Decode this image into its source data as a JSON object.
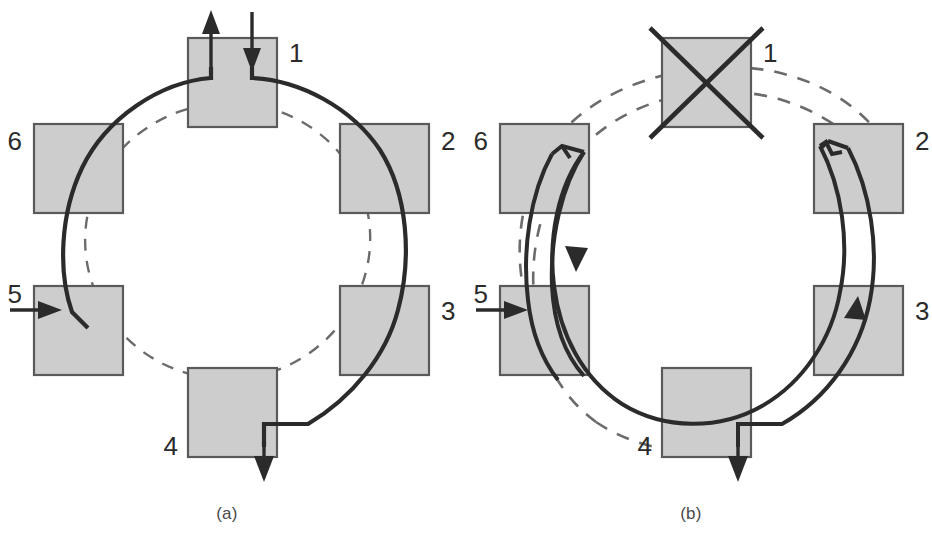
{
  "figure": {
    "type": "ring-diagram-pair",
    "background": "#ffffff",
    "node_fill": "#cdcdcd",
    "node_stroke": "#5a5a5a",
    "line_color": "#2b2b2b",
    "dash_color": "#6b6b6b",
    "panels": [
      {
        "id": "a",
        "caption": "(a)",
        "nodes": [
          {
            "id": "n1",
            "label": "1",
            "angle_deg": 90,
            "label_side": "right",
            "crossed_out": false
          },
          {
            "id": "n2",
            "label": "2",
            "angle_deg": 30,
            "label_side": "right",
            "crossed_out": false
          },
          {
            "id": "n3",
            "label": "3",
            "angle_deg": -30,
            "label_side": "right",
            "crossed_out": false
          },
          {
            "id": "n4",
            "label": "4",
            "angle_deg": -90,
            "label_side": "left",
            "crossed_out": false
          },
          {
            "id": "n5",
            "label": "5",
            "angle_deg": -150,
            "label_side": "left",
            "crossed_out": false
          },
          {
            "id": "n6",
            "label": "6",
            "angle_deg": 150,
            "label_side": "left",
            "crossed_out": false
          }
        ],
        "arrows": [
          {
            "name": "input-arrow-node1",
            "kind": "vertical-down-into-node",
            "at_node": "n1"
          },
          {
            "name": "output-arrow-node1",
            "kind": "vertical-up-out-of-node",
            "at_node": "n1"
          },
          {
            "name": "output-arrow-node4",
            "kind": "vertical-down-out-of-node",
            "at_node": "n4"
          },
          {
            "name": "input-arrow-node5",
            "kind": "horizontal-right-into-node",
            "at_node": "n5"
          }
        ],
        "paths": [
          {
            "name": "solid-ring-path",
            "style": "solid",
            "thick": true
          },
          {
            "name": "dashed-inner-ring-path",
            "style": "dashed",
            "thick": false
          }
        ]
      },
      {
        "id": "b",
        "caption": "(b)",
        "nodes": [
          {
            "id": "n1",
            "label": "1",
            "angle_deg": 90,
            "label_side": "right",
            "crossed_out": true
          },
          {
            "id": "n2",
            "label": "2",
            "angle_deg": 30,
            "label_side": "right",
            "crossed_out": false
          },
          {
            "id": "n3",
            "label": "3",
            "angle_deg": -30,
            "label_side": "right",
            "crossed_out": false
          },
          {
            "id": "n4",
            "label": "4",
            "angle_deg": -90,
            "label_side": "left",
            "crossed_out": false
          },
          {
            "id": "n5",
            "label": "5",
            "angle_deg": -150,
            "label_side": "left",
            "crossed_out": false
          },
          {
            "id": "n6",
            "label": "6",
            "angle_deg": 150,
            "label_side": "left",
            "crossed_out": false
          }
        ],
        "arrows": [
          {
            "name": "output-arrow-node4",
            "kind": "vertical-down-out-of-node",
            "at_node": "n4"
          },
          {
            "name": "input-arrow-node5",
            "kind": "horizontal-right-into-node",
            "at_node": "n5"
          },
          {
            "name": "flow-arrowhead-node6",
            "kind": "arc-arrowhead-downward",
            "at_node": "n6"
          },
          {
            "name": "flow-arrowhead-node3",
            "kind": "arc-arrowhead-upward",
            "at_node": "n3"
          }
        ],
        "paths": [
          {
            "name": "solid-ring-path",
            "style": "solid",
            "thick": true
          },
          {
            "name": "reconfigured-loop-path",
            "style": "solid",
            "thick": true
          },
          {
            "name": "dashed-inner-ring-path",
            "style": "dashed",
            "thick": false
          },
          {
            "name": "dashed-outer-ring-path",
            "style": "dashed",
            "thick": false
          }
        ]
      }
    ]
  }
}
